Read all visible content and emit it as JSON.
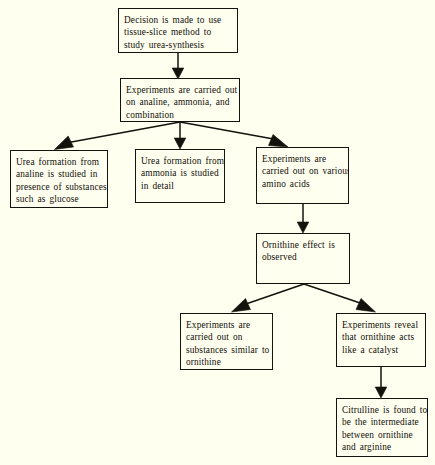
{
  "diagram": {
    "background_color": "#fffff0",
    "line_color": "#14120c",
    "text_color": "#100e08",
    "nodes": [
      {
        "id": "decision",
        "lines": [
          "Decision is made to use",
          "tissue-slice method to",
          "study  urea-synthesis"
        ],
        "x": 118,
        "y": 8,
        "w": 120,
        "h": 45
      },
      {
        "id": "experiments-analine",
        "lines": [
          "Experiments are carried out",
          "on analine, ammonia, and",
          "combination"
        ],
        "x": 120,
        "y": 78,
        "w": 120,
        "h": 44
      },
      {
        "id": "urea-from-analine",
        "lines": [
          "Urea formation from",
          "analine is studied in",
          "presence of substances",
          "such as glucose"
        ],
        "x": 10,
        "y": 150,
        "w": 98,
        "h": 58
      },
      {
        "id": "urea-from-ammonia",
        "lines": [
          "Urea formation from",
          "ammonia is studied",
          "in detail"
        ],
        "x": 135,
        "y": 149,
        "w": 90,
        "h": 54
      },
      {
        "id": "various-amino-acids",
        "lines": [
          "Experiments are",
          "carried out on various",
          "amino acids"
        ],
        "x": 256,
        "y": 147,
        "w": 93,
        "h": 57
      },
      {
        "id": "ornithine-effect",
        "lines": [
          "Ornithine effect is",
          "observed"
        ],
        "x": 256,
        "y": 233,
        "w": 94,
        "h": 51
      },
      {
        "id": "substances-similar",
        "lines": [
          "Experiments are",
          "carried out on",
          "substances similar to",
          "ornithine"
        ],
        "x": 180,
        "y": 313,
        "w": 93,
        "h": 57
      },
      {
        "id": "ornithine-catalyst",
        "lines": [
          "Experiments reveal",
          "that ornithine acts",
          "like a catalyst"
        ],
        "x": 336,
        "y": 313,
        "w": 90,
        "h": 54
      },
      {
        "id": "citrulline",
        "lines": [
          "Citrulline is found to",
          "be the intermediate",
          "between ornithine",
          "and arginine"
        ],
        "x": 336,
        "y": 398,
        "w": 92,
        "h": 59
      }
    ],
    "edges": [
      {
        "id": "decision-to-experiments",
        "from": "decision",
        "to": "experiments-analine"
      },
      {
        "id": "experiments-to-analine-box",
        "from": "experiments-analine",
        "to": "urea-from-analine"
      },
      {
        "id": "experiments-to-ammonia-box",
        "from": "experiments-analine",
        "to": "urea-from-ammonia"
      },
      {
        "id": "experiments-to-amino-acids",
        "from": "experiments-analine",
        "to": "various-amino-acids"
      },
      {
        "id": "amino-acids-to-ornithine-effect",
        "from": "various-amino-acids",
        "to": "ornithine-effect"
      },
      {
        "id": "ornithine-effect-to-substances",
        "from": "ornithine-effect",
        "to": "substances-similar"
      },
      {
        "id": "ornithine-effect-to-catalyst",
        "from": "ornithine-effect",
        "to": "ornithine-catalyst"
      },
      {
        "id": "catalyst-to-citrulline",
        "from": "ornithine-catalyst",
        "to": "citrulline"
      }
    ]
  }
}
